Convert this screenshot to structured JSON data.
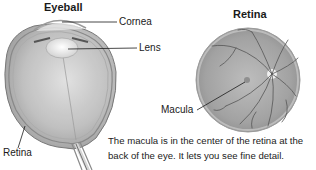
{
  "eyeball": {
    "title": "Eyeball",
    "labels": {
      "cornea": "Cornea",
      "lens": "Lens",
      "retina": "Retina"
    }
  },
  "retina": {
    "title": "Retina",
    "labels": {
      "macula": "Macula"
    }
  },
  "caption": {
    "line1": "The macula is in the center of the retina at the",
    "line2": "back of the eye. It lets you see fine detail."
  },
  "colors": {
    "ink": "#1a1a1a",
    "tissue_light": "#d8d8d8",
    "tissue_mid": "#a9a9a9",
    "tissue_dark": "#6e6e6e",
    "background": "#ffffff"
  }
}
